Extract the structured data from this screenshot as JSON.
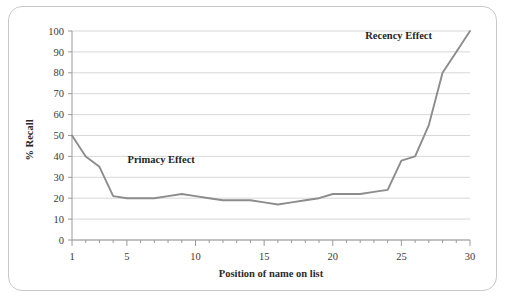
{
  "chart_data": {
    "type": "line",
    "title": "",
    "xlabel": "Position  of name on list",
    "ylabel": "% Recall",
    "xlim": [
      1,
      30
    ],
    "ylim": [
      0,
      100
    ],
    "grid": true,
    "legend_position": "none",
    "x_tick_labels": [
      "1",
      "5",
      "10",
      "15",
      "20",
      "25",
      "30"
    ],
    "x_tick_values": [
      1,
      5,
      10,
      15,
      20,
      25,
      30
    ],
    "y_tick_labels": [
      "0",
      "10",
      "20",
      "30",
      "40",
      "50",
      "60",
      "70",
      "80",
      "90",
      "100"
    ],
    "y_tick_values": [
      0,
      10,
      20,
      30,
      40,
      50,
      60,
      70,
      80,
      90,
      100
    ],
    "series": [
      {
        "name": "% Recall",
        "color": "#8c8c8c",
        "x": [
          1,
          2,
          3,
          4,
          5,
          6,
          7,
          8,
          9,
          10,
          11,
          12,
          13,
          14,
          15,
          16,
          17,
          18,
          19,
          20,
          21,
          22,
          23,
          24,
          25,
          26,
          27,
          28,
          29,
          30
        ],
        "values": [
          50,
          40,
          35,
          21,
          20,
          20,
          20,
          21,
          22,
          21,
          20,
          19,
          19,
          19,
          18,
          17,
          18,
          19,
          20,
          22,
          22,
          22,
          23,
          24,
          38,
          40,
          55,
          80,
          90,
          100
        ]
      }
    ],
    "annotations": [
      {
        "name": "primacy-effect",
        "text": "Primacy Effect",
        "x": 7.5,
        "y": 37
      },
      {
        "name": "recency-effect",
        "text": "Recency Effect",
        "x": 24.8,
        "y": 96
      }
    ],
    "colors": {
      "line": "#8c8c8c",
      "grid": "#d4d4d4",
      "axis": "#9a9a9a",
      "text": "#2b2b2b",
      "frame": "#c9c9c9",
      "background": "#ffffff"
    }
  }
}
